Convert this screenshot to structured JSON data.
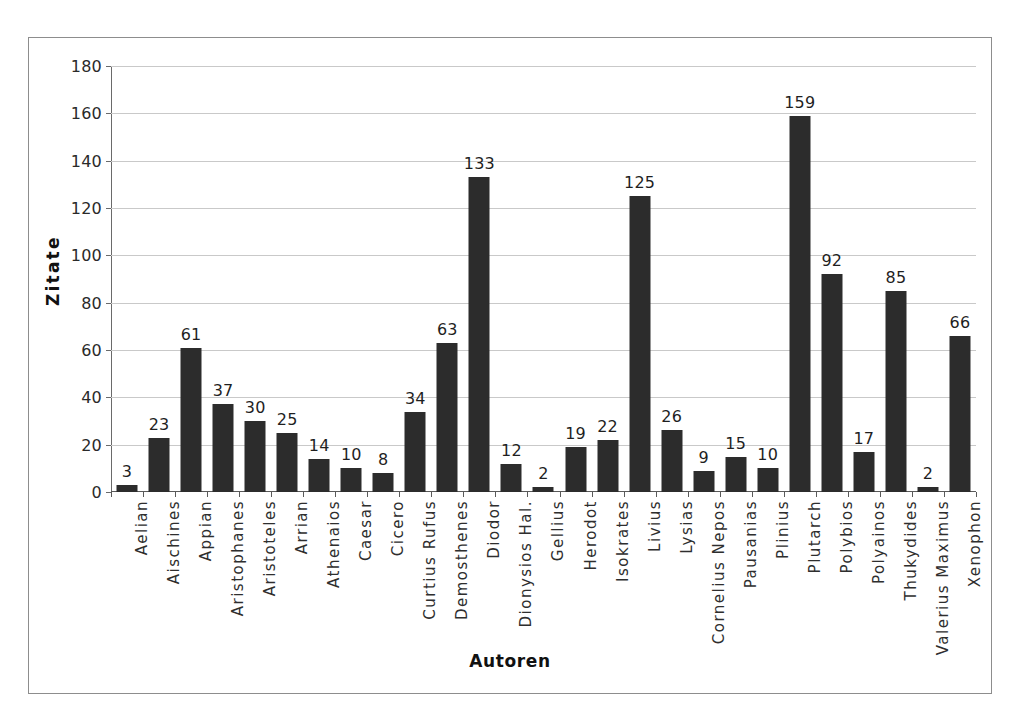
{
  "chart_data": {
    "type": "bar",
    "title": "",
    "xlabel": "Autoren",
    "ylabel": "Zitate",
    "ylim": [
      0,
      180
    ],
    "ytick_step": 20,
    "yticks": [
      0,
      20,
      40,
      60,
      80,
      100,
      120,
      140,
      160,
      180
    ],
    "grid": true,
    "legend": "none",
    "bar_color": "#2c2c2c",
    "gridline_color": "#c9c9c9",
    "axis_color": "#5a5a5a",
    "label_rotation": -90,
    "show_value_labels": true,
    "categories": [
      "Aelian",
      "Aischines",
      "Appian",
      "Aristophanes",
      "Aristoteles",
      "Arrian",
      "Athenaios",
      "Caesar",
      "Cicero",
      "Curtius Rufus",
      "Demosthenes",
      "Diodor",
      "Dionysios Hal.",
      "Gellius",
      "Herodot",
      "Isokrates",
      "Livius",
      "Lysias",
      "Cornelius Nepos",
      "Pausanias",
      "Plinius",
      "Plutarch",
      "Polybios",
      "Polyainos",
      "Thukydides",
      "Valerius Maximus",
      "Xenophon"
    ],
    "values": [
      3,
      23,
      61,
      37,
      30,
      25,
      14,
      10,
      8,
      34,
      63,
      133,
      12,
      2,
      19,
      22,
      125,
      26,
      9,
      15,
      10,
      159,
      92,
      17,
      85,
      2,
      66
    ]
  }
}
